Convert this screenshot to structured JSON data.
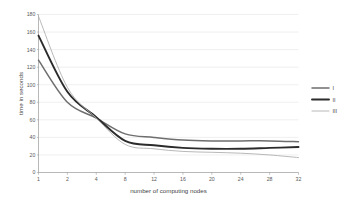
{
  "chart_data": {
    "type": "line",
    "title": "",
    "subtitle": "",
    "xlabel": "number of computing nodes",
    "ylabel": "time in seconds",
    "categories": [
      "1",
      "2",
      "4",
      "8",
      "12",
      "16",
      "20",
      "24",
      "28",
      "32"
    ],
    "x": [
      1,
      2,
      4,
      8,
      12,
      16,
      20,
      24,
      28,
      32
    ],
    "ylim": [
      0,
      180
    ],
    "ytick_step": 20,
    "yticks": [
      "0",
      "20",
      "40",
      "60",
      "80",
      "100",
      "120",
      "140",
      "160",
      "180"
    ],
    "xticks": [
      "1",
      "2",
      "4",
      "8",
      "12",
      "16",
      "20",
      "24",
      "28",
      "32"
    ],
    "grid": "horizontal",
    "legend_position": "right-outside",
    "series": [
      {
        "name": "I",
        "color": "#6e6e6e",
        "width": 1.5,
        "values": [
          128,
          80,
          62,
          44,
          40,
          37,
          36,
          36,
          36,
          35
        ]
      },
      {
        "name": "II",
        "color": "#2b2b2b",
        "width": 1.9,
        "values": [
          156,
          92,
          63,
          36,
          31,
          28,
          27,
          27,
          28,
          29
        ]
      },
      {
        "name": "III",
        "color": "#b0b0b0",
        "width": 0.9,
        "values": [
          178,
          97,
          62,
          32,
          27,
          24,
          23,
          22,
          20,
          17
        ]
      }
    ]
  },
  "axes": {
    "y_title": "time in seconds",
    "x_title": "number of computing nodes"
  },
  "legend": {
    "items": [
      {
        "label": "I"
      },
      {
        "label": "II"
      },
      {
        "label": "III"
      }
    ]
  }
}
